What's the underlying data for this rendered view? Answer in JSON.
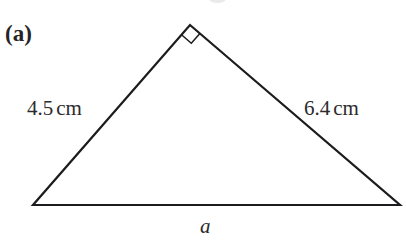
{
  "figure": {
    "part_label": "(a)",
    "background_color": "#ffffff",
    "stroke_color": "#1c1c1e",
    "text_color": "#2b2b2d",
    "width": 406,
    "height": 246
  },
  "triangle": {
    "vertices": {
      "apex": {
        "x": 190,
        "y": 25
      },
      "bottom_left": {
        "x": 33,
        "y": 205
      },
      "bottom_right": {
        "x": 400,
        "y": 205
      }
    },
    "stroke_width": 2.2,
    "right_angle": {
      "at": "apex",
      "marker": "square",
      "marker_size": 26
    }
  },
  "labels": {
    "side_left": {
      "value": "4.5",
      "unit": "cm",
      "full": "4.5 cm"
    },
    "side_right": {
      "value": "6.4",
      "unit": "cm",
      "full": "6.4 cm"
    },
    "base": {
      "value": "a"
    }
  },
  "chart_data": {
    "type": "diagram",
    "title": "(a)",
    "shape": "right triangle",
    "annotations": [
      {
        "name": "hypotenuse-base",
        "label": "a",
        "position": "bottom",
        "known": false
      },
      {
        "name": "leg-left",
        "label": "4.5 cm",
        "position": "upper-left",
        "known": true,
        "length": 4.5,
        "unit": "cm"
      },
      {
        "name": "leg-right",
        "label": "6.4 cm",
        "position": "upper-right",
        "known": true,
        "length": 6.4,
        "unit": "cm"
      },
      {
        "name": "right-angle-marker",
        "label": "90°",
        "position": "apex",
        "known": true
      }
    ]
  }
}
